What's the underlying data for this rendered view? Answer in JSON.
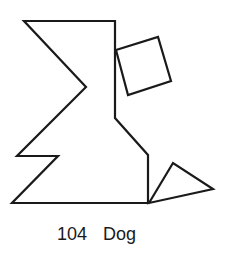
{
  "figure": {
    "number": "104",
    "name": "Dog",
    "stroke_color": "#1a1a1a",
    "stroke_width": 2.2,
    "background": "#ffffff",
    "shapes": {
      "body": "24,21 115,21 115,118 148,155 148,203 12,203 58,156 17,156 86,87",
      "head_square": "116,50 158,37 171,81 128,95",
      "tail_triangle": "149,203 173,163 213,189"
    }
  }
}
